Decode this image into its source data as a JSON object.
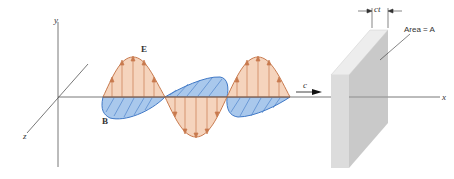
{
  "diagram": {
    "type": "electromagnetic-wave-figure",
    "axes": {
      "x_label": "x",
      "y_label": "y",
      "z_label": "z"
    },
    "vectors": {
      "electric": "E",
      "magnetic": "B"
    },
    "wave_speed_label": "c",
    "slab": {
      "thickness_label": "ct",
      "area_label": "Area = A"
    },
    "colors": {
      "electric_fill": "#f3cdb2",
      "electric_stroke": "#c87a4e",
      "magnetic_fill": "#a9c8ec",
      "magnetic_stroke": "#3f78c6",
      "slab_front": "#d9d9d9",
      "slab_side": "#c4c4c4",
      "slab_top": "#ededed",
      "axis": "#555555"
    }
  }
}
